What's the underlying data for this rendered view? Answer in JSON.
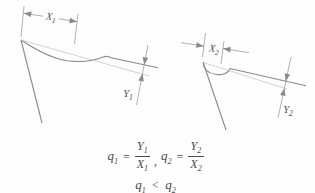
{
  "colors": {
    "line": "#8a8a8a",
    "thin_line": "#c0c0c0",
    "dim_line": "#8f8f8f",
    "text": "#4f4f4f",
    "background": "#fdfdfd"
  },
  "figures": {
    "left": {
      "x_label": {
        "base": "X",
        "sub": "1"
      },
      "y_label": {
        "base": "Y",
        "sub": "1"
      }
    },
    "right": {
      "x_label": {
        "base": "X",
        "sub": "2"
      },
      "y_label": {
        "base": "Y",
        "sub": "2"
      }
    }
  },
  "equations": {
    "eq1": {
      "lhs": "q",
      "lhs_sub": "1",
      "rel": "=",
      "num": "Y",
      "num_sub": "1",
      "den": "X",
      "den_sub": "1"
    },
    "separator": ",",
    "eq2": {
      "lhs": "q",
      "lhs_sub": "2",
      "rel": "=",
      "num": "Y",
      "num_sub": "2",
      "den": "X",
      "den_sub": "2"
    },
    "relation": {
      "lhs": "q",
      "lhs_sub": "1",
      "op": "<",
      "rhs": "q",
      "rhs_sub": "2"
    }
  }
}
